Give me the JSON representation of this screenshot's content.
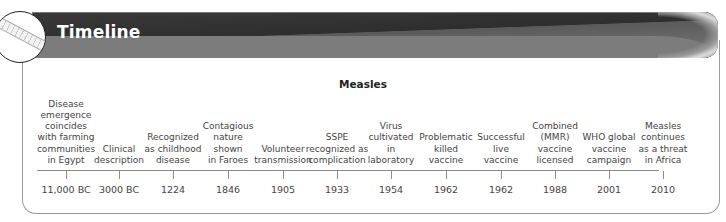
{
  "header": {
    "title": "Timeline",
    "icon": "ruler-icon"
  },
  "timeline": {
    "heading": "Measles",
    "events": [
      {
        "x": 66,
        "year": "11,000 BC",
        "lines": [
          "Disease",
          "emergence",
          "coincides",
          "with farming",
          "communities",
          "in Egypt"
        ]
      },
      {
        "x": 119,
        "year": "3000 BC",
        "lines": [
          "Clinical",
          "description"
        ]
      },
      {
        "x": 173,
        "year": "1224",
        "lines": [
          "Recognized",
          "as childhood",
          "disease"
        ]
      },
      {
        "x": 228,
        "year": "1846",
        "lines": [
          "Contagious",
          "nature",
          "shown",
          "in Faroes"
        ]
      },
      {
        "x": 283,
        "year": "1905",
        "lines": [
          "Volunteer",
          "transmission"
        ]
      },
      {
        "x": 337,
        "year": "1933",
        "lines": [
          "SSPE",
          "recognized as",
          "complication"
        ]
      },
      {
        "x": 391,
        "year": "1954",
        "lines": [
          "Virus",
          "cultivated",
          "in",
          "laboratory"
        ]
      },
      {
        "x": 446,
        "year": "1962",
        "lines": [
          "Problematic",
          "killed",
          "vaccine"
        ]
      },
      {
        "x": 501,
        "year": "1962",
        "lines": [
          "Successful",
          "live",
          "vaccine"
        ]
      },
      {
        "x": 555,
        "year": "1988",
        "lines": [
          "Combined",
          "(MMR)",
          "vaccine",
          "licensed"
        ]
      },
      {
        "x": 609,
        "year": "2001",
        "lines": [
          "WHO global",
          "vaccine",
          "campaign"
        ]
      },
      {
        "x": 663,
        "year": "2010",
        "lines": [
          "Measles",
          "continues",
          "as a threat",
          "in Africa"
        ]
      }
    ]
  }
}
